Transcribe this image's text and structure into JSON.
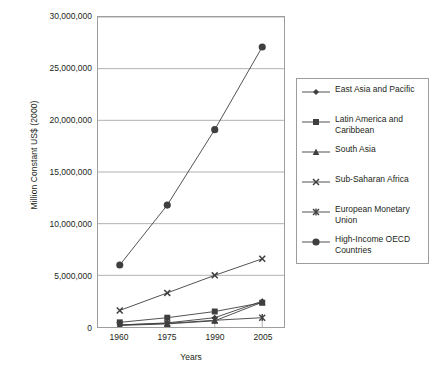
{
  "chart_data": {
    "type": "line",
    "title": "",
    "xlabel": "Years",
    "ylabel": "Million Constant US$ (2000)",
    "categories": [
      "1960",
      "1975",
      "1990",
      "2005"
    ],
    "x": [
      1960,
      1975,
      1990,
      2005
    ],
    "ylim": [
      0,
      30000000
    ],
    "yticks": [
      0,
      5000000,
      10000000,
      15000000,
      20000000,
      25000000,
      30000000
    ],
    "ytick_labels": [
      "0",
      "5,000,000",
      "10,000,000",
      "15,000,000",
      "20,000,000",
      "25,000,000",
      "30,000,000"
    ],
    "grid": "horizontal",
    "legend_position": "right",
    "series": [
      {
        "name": "East Asia and Pacific",
        "marker": "diamond",
        "values": [
          200000,
          400000,
          900000,
          2500000
        ]
      },
      {
        "name": "Latin America and Caribbean",
        "marker": "square",
        "values": [
          450000,
          900000,
          1500000,
          2350000
        ]
      },
      {
        "name": "South Asia",
        "marker": "triangle",
        "values": [
          150000,
          300000,
          600000,
          2400000
        ]
      },
      {
        "name": "Sub-Saharan Africa",
        "marker": "x",
        "values": [
          1600000,
          3300000,
          5000000,
          6600000
        ]
      },
      {
        "name": "European Monetary Union",
        "marker": "asterisk",
        "values": [
          200000,
          350000,
          650000,
          900000
        ]
      },
      {
        "name": "High-Income OECD Countries",
        "marker": "circle",
        "values": [
          6000000,
          11800000,
          19100000,
          27100000
        ]
      }
    ]
  },
  "colors": {
    "line": "#3f3f3f",
    "grid": "#9d9d9d",
    "frame": "#9d9d9d",
    "text": "#231f20",
    "background": "#ffffff"
  },
  "legend": {
    "items": [
      {
        "label": "East Asia and Pacific"
      },
      {
        "label": "Latin America and\nCaribbean"
      },
      {
        "label": "South Asia"
      },
      {
        "label": "Sub-Saharan Africa"
      },
      {
        "label": "European Monetary\nUnion"
      },
      {
        "label": "High-Income OECD\nCountries"
      }
    ]
  }
}
